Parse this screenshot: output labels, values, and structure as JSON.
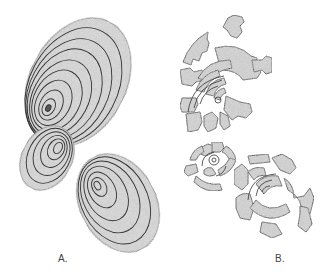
{
  "figure": {
    "panels": [
      {
        "id": "A",
        "label": "A.",
        "description": "Three intact ovoid bodies with nested concentric contour rings",
        "shapes": [
          {
            "name": "large-ovoid",
            "cx": 78,
            "cy": 80,
            "rx": 50,
            "ry": 68,
            "rotate": 25,
            "rings": 9
          },
          {
            "name": "small-ovoid",
            "cx": 47,
            "cy": 158,
            "rx": 25,
            "ry": 33,
            "rotate": 25,
            "rings": 6
          },
          {
            "name": "medium-ovoid",
            "cx": 118,
            "cy": 203,
            "rx": 38,
            "ry": 50,
            "rotate": -25,
            "rings": 6
          }
        ]
      },
      {
        "id": "B",
        "label": "B.",
        "description": "Three fragmented bodies broken into radial concentric-ring fragments",
        "shapes": [
          {
            "name": "large-fragmented",
            "cx": 222,
            "cy": 95,
            "r": 55
          },
          {
            "name": "small-fragmented",
            "cx": 215,
            "cy": 163,
            "r": 28
          },
          {
            "name": "medium-fragmented",
            "cx": 265,
            "cy": 195,
            "r": 42
          }
        ]
      }
    ],
    "colors": {
      "fill": "#dcdcdc",
      "stroke": "#444444",
      "background": "#ffffff"
    }
  }
}
